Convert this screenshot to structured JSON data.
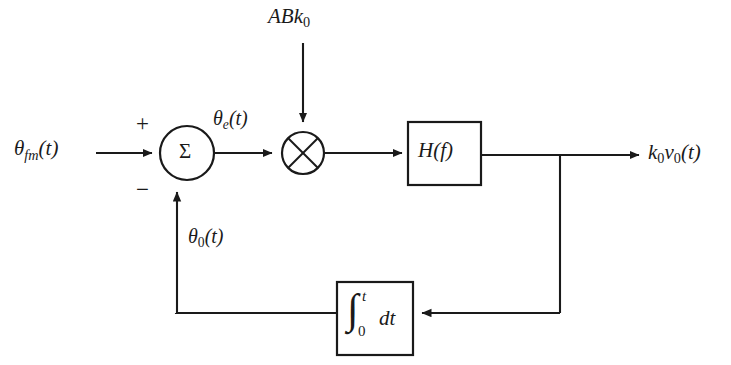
{
  "diagram": {
    "stroke_color": "#1a1a1a",
    "background_color": "#ffffff",
    "labels": {
      "input_signal": "θfm(t)",
      "input_theta_base": "θ",
      "input_theta_sub": "fm",
      "input_theta_arg": "(t)",
      "error_signal": "θe(t)",
      "error_theta_base": "θ",
      "error_theta_sub": "e",
      "error_theta_arg": "(t)",
      "gain_input": "ABk0",
      "gain_input_base": "ABk",
      "gain_input_sub": "0",
      "filter_block": "H(f)",
      "output_signal": "k0v0(t)",
      "output_base_k": "k",
      "output_sub_k": "0",
      "output_base_v": "v",
      "output_sub_v": "0",
      "output_arg": "(t)",
      "feedback_signal": "θ0(t)",
      "feedback_theta_base": "θ",
      "feedback_theta_sub": "0",
      "feedback_theta_arg": "(t)",
      "sum_plus": "+",
      "sum_minus": "−",
      "sum_symbol": "Σ",
      "integrator_sign": "∫",
      "integrator_upper_limit": "t",
      "integrator_lower_limit": "0",
      "integrator_differential": "dt",
      "multiplier_symbol": "✕"
    },
    "blocks": [
      {
        "name": "summing-junction",
        "shape": "circle",
        "label": "Σ",
        "cx": 187,
        "cy": 153,
        "r": 27
      },
      {
        "name": "multiplier",
        "shape": "circle",
        "label": "✕",
        "cx": 303,
        "cy": 153,
        "r": 21
      },
      {
        "name": "filter",
        "shape": "rect",
        "label": "H(f)",
        "x": 408,
        "y": 122,
        "w": 73,
        "h": 63
      },
      {
        "name": "integrator",
        "shape": "rect",
        "label": "∫0t dt",
        "x": 337,
        "y": 282,
        "w": 76,
        "h": 73
      }
    ],
    "connections": [
      {
        "from": "input",
        "to": "summing-junction",
        "label": "θfm(t)"
      },
      {
        "from": "gain-source",
        "to": "multiplier",
        "label": "ABk0"
      },
      {
        "from": "summing-junction",
        "to": "multiplier",
        "label": "θe(t)"
      },
      {
        "from": "multiplier",
        "to": "filter",
        "label": ""
      },
      {
        "from": "filter",
        "to": "output",
        "label": "k0v0(t)"
      },
      {
        "from": "filter-tap",
        "to": "integrator",
        "label": ""
      },
      {
        "from": "integrator",
        "to": "summing-junction",
        "label": "θ0(t)"
      }
    ]
  }
}
